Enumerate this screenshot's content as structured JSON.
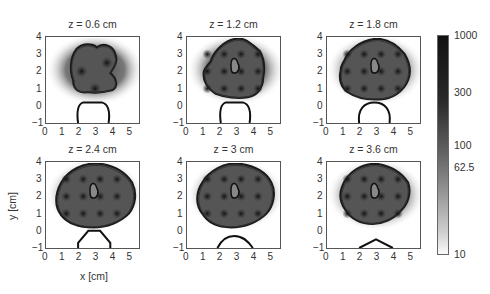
{
  "chart_data": {
    "type": "heatmap",
    "title": "",
    "xlabel": "x [cm]",
    "ylabel": "y [cm]",
    "xlim": [
      0,
      5.5
    ],
    "ylim": [
      -1,
      4
    ],
    "xticks": [
      "0",
      "1",
      "2",
      "3",
      "4",
      "5"
    ],
    "yticks": [
      "4",
      "3",
      "2",
      "1",
      "0",
      "−1"
    ],
    "grid": false,
    "panels": [
      {
        "title": "z = 0.6 cm",
        "z_cm": 0.6
      },
      {
        "title": "z = 1.2 cm",
        "z_cm": 1.2
      },
      {
        "title": "z = 1.8 cm",
        "z_cm": 1.8
      },
      {
        "title": "z = 2.4 cm",
        "z_cm": 2.4
      },
      {
        "title": "z = 3 cm",
        "z_cm": 3
      },
      {
        "title": "z = 3.6 cm",
        "z_cm": 3.6
      }
    ],
    "colorbar": {
      "scale": "log",
      "range": [
        10,
        1000
      ],
      "ticks": [
        "1000",
        "300",
        "100",
        "62.5",
        "10"
      ],
      "tick_values": [
        1000,
        300,
        100,
        62.5,
        10
      ],
      "colormap": "gray_r"
    }
  }
}
